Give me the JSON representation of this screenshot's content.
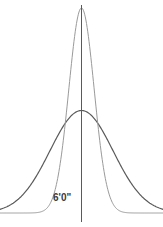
{
  "chart_data": {
    "type": "line",
    "title": "",
    "subtitle": "",
    "xlabel": "",
    "ylabel": "",
    "grid": false,
    "legend": "none",
    "annotations": [
      {
        "name": "mean-marker-label",
        "text": "6'0\"",
        "x": 0,
        "description": "Vertical line marking the shared mean of both distributions, labeled six feet zero inches"
      }
    ],
    "axis": {
      "x_range": [
        -4.0,
        4.0
      ],
      "y_range": [
        0,
        1.0
      ],
      "x_ticks": [],
      "y_ticks": [],
      "x_tick_labels": [],
      "y_tick_labels": []
    },
    "vertical_line": {
      "x": 0,
      "label": "6'0\"",
      "color": "#5a5a5a"
    },
    "series": [
      {
        "name": "narrow-distribution",
        "kind": "normal-curve",
        "mean": 0,
        "sigma": 0.62,
        "peak_height": 1.0,
        "color": "#9a9a9a",
        "linewidth": 1.0,
        "x": [
          -4.0,
          -3.6,
          -3.2,
          -2.8,
          -2.4,
          -2.0,
          -1.6,
          -1.2,
          -0.8,
          -0.4,
          0.0,
          0.4,
          0.8,
          1.2,
          1.6,
          2.0,
          2.4,
          2.8,
          3.2,
          3.6,
          4.0
        ],
        "values": [
          0.0,
          0.0,
          0.0,
          0.0,
          0.001,
          0.006,
          0.036,
          0.155,
          0.435,
          0.813,
          1.0,
          0.813,
          0.435,
          0.155,
          0.036,
          0.006,
          0.001,
          0.0,
          0.0,
          0.0,
          0.0
        ]
      },
      {
        "name": "wide-distribution",
        "kind": "normal-curve",
        "mean": 0,
        "sigma": 1.55,
        "peak_height": 0.5,
        "color": "#5a5a5a",
        "linewidth": 1.2,
        "x": [
          -4.0,
          -3.6,
          -3.2,
          -2.8,
          -2.4,
          -2.0,
          -1.6,
          -1.2,
          -0.8,
          -0.4,
          0.0,
          0.4,
          0.8,
          1.2,
          1.6,
          2.0,
          2.4,
          2.8,
          3.2,
          3.6,
          4.0
        ],
        "values": [
          0.0187,
          0.0351,
          0.0613,
          0.0996,
          0.1508,
          0.2122,
          0.2779,
          0.3389,
          0.3847,
          0.4077,
          0.5,
          0.4077,
          0.3847,
          0.3389,
          0.2779,
          0.2122,
          0.1508,
          0.0996,
          0.0613,
          0.0351,
          0.0187
        ]
      }
    ],
    "colors": {
      "background": "#ffffff",
      "narrow_curve": "#9a9a9a",
      "wide_curve": "#5a5a5a",
      "mean_line": "#5a5a5a",
      "label_text": "#3a3a3a"
    }
  }
}
